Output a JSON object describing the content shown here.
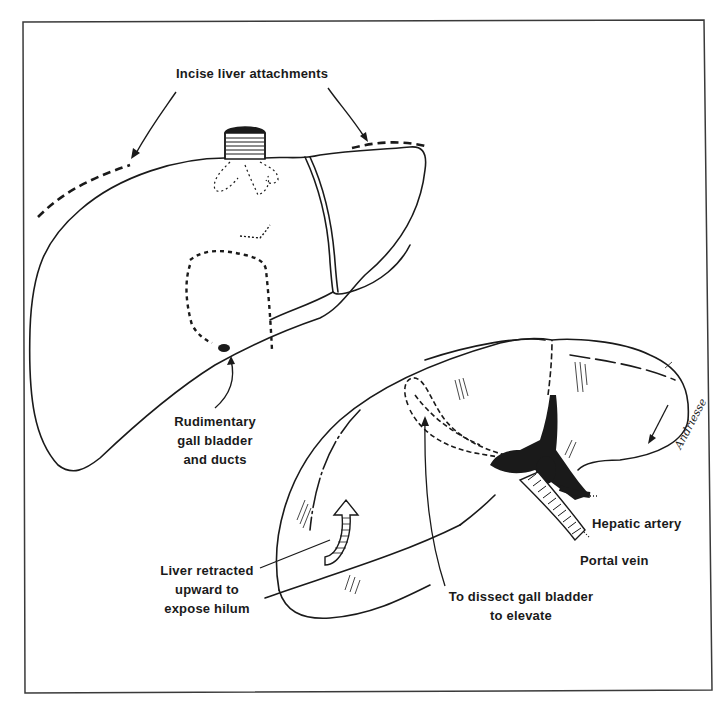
{
  "figure": {
    "frame_color": "#3a3a3a",
    "ink_color": "#1a1a1a",
    "background": "#ffffff"
  },
  "labels": {
    "incise": "Incise liver attachments",
    "rudimentary": [
      "Rudimentary",
      "gall bladder",
      "and ducts"
    ],
    "retracted": [
      "Liver retracted",
      "upward to",
      "expose hilum"
    ],
    "dissect": [
      "To dissect gall bladder",
      "to elevate"
    ],
    "hepatic_artery": "Hepatic artery",
    "portal_vein": "Portal vein"
  },
  "signature": "Andriesse"
}
